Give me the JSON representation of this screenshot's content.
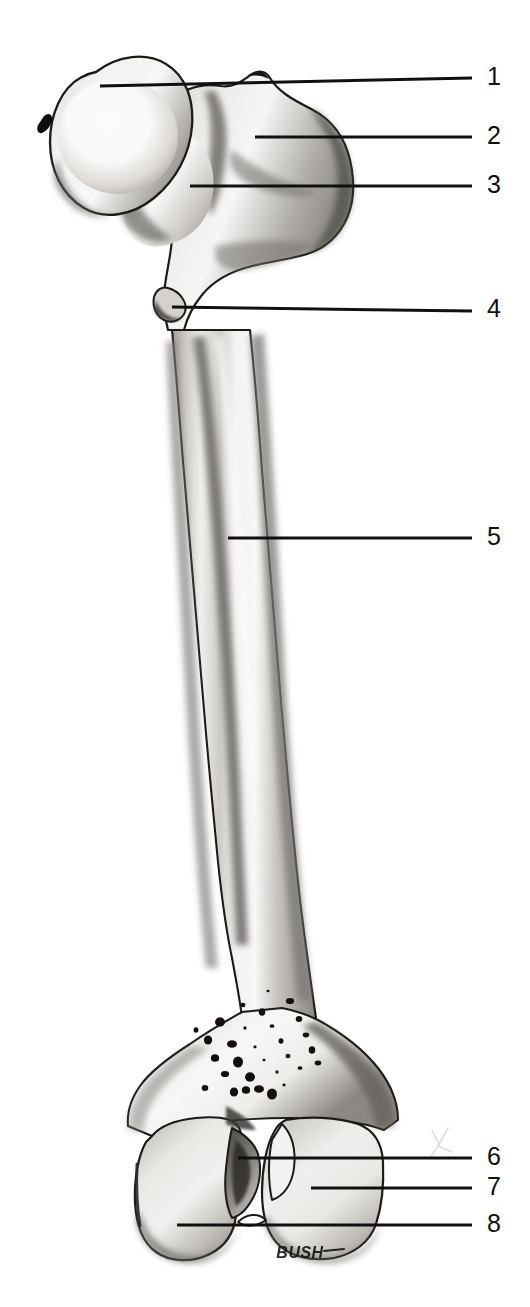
{
  "figure": {
    "kind": "anatomical-line-illustration",
    "view": "anterior",
    "background_color": "#ffffff",
    "ink_color": "#101010",
    "bone_fill_color": "#f2f1ef",
    "shadow_color": "#8d8b88",
    "signature": "BUSH",
    "dimensions": {
      "width": 530,
      "height": 1307
    }
  },
  "callouts": {
    "count": 8,
    "items": [
      {
        "number": "1",
        "num_x": 487,
        "num_y": 64,
        "line_y": 78,
        "line_x_start": 100,
        "line_x_end": 472,
        "tip_y": 86
      },
      {
        "number": "2",
        "num_x": 487,
        "num_y": 123,
        "line_y": 137,
        "line_x_start": 255,
        "line_x_end": 472,
        "tip_y": 137
      },
      {
        "number": "3",
        "num_x": 487,
        "num_y": 172,
        "line_y": 186,
        "line_x_start": 190,
        "line_x_end": 472,
        "tip_y": 186
      },
      {
        "number": "4",
        "num_x": 487,
        "num_y": 296,
        "line_y": 311,
        "line_x_start": 172,
        "line_x_end": 472,
        "tip_y": 307
      },
      {
        "number": "5",
        "num_x": 487,
        "num_y": 524,
        "line_y": 538,
        "line_x_start": 228,
        "line_x_end": 472,
        "tip_y": 538
      },
      {
        "number": "6",
        "num_x": 487,
        "num_y": 1144,
        "line_y": 1158,
        "line_x_start": 238,
        "line_x_end": 472,
        "tip_y": 1158
      },
      {
        "number": "7",
        "num_x": 487,
        "num_y": 1174,
        "line_y": 1188,
        "line_x_start": 311,
        "line_x_end": 472,
        "tip_y": 1188
      },
      {
        "number": "8",
        "num_x": 487,
        "num_y": 1211,
        "line_y": 1225,
        "line_x_start": 177,
        "line_x_end": 472,
        "tip_y": 1225
      }
    ]
  },
  "regions": [
    {
      "id": "head",
      "data_name": "femoral-head",
      "callout": "1"
    },
    {
      "id": "greater-trochanter",
      "data_name": "greater-trochanter",
      "callout": "2"
    },
    {
      "id": "neck",
      "data_name": "femoral-neck",
      "callout": "3"
    },
    {
      "id": "lesser-trochanter",
      "data_name": "lesser-trochanter",
      "callout": "4"
    },
    {
      "id": "shaft",
      "data_name": "femoral-shaft-body",
      "callout": "5"
    },
    {
      "id": "intercondylar-fossa",
      "data_name": "intercondylar-fossa",
      "callout": "6"
    },
    {
      "id": "medial-condyle",
      "data_name": "condyle-right",
      "callout": "7"
    },
    {
      "id": "lateral-condyle",
      "data_name": "condyle-left",
      "callout": "8"
    }
  ],
  "marks": {
    "nutrient_foramina": [
      [
        268,
        991
      ],
      [
        243,
        1005
      ],
      [
        262,
        1012
      ],
      [
        290,
        1001
      ],
      [
        220,
        1022
      ],
      [
        245,
        1028
      ],
      [
        272,
        1026
      ],
      [
        299,
        1019
      ],
      [
        208,
        1040
      ],
      [
        232,
        1044
      ],
      [
        255,
        1047
      ],
      [
        281,
        1041
      ],
      [
        306,
        1035
      ],
      [
        215,
        1058
      ],
      [
        238,
        1062
      ],
      [
        264,
        1060
      ],
      [
        288,
        1056
      ],
      [
        312,
        1050
      ],
      [
        225,
        1074
      ],
      [
        250,
        1077
      ],
      [
        277,
        1072
      ],
      [
        300,
        1068
      ],
      [
        205,
        1088
      ],
      [
        234,
        1092
      ],
      [
        259,
        1089
      ],
      [
        284,
        1085
      ],
      [
        196,
        1030
      ],
      [
        318,
        1063
      ],
      [
        246,
        1090
      ],
      [
        272,
        1094
      ]
    ],
    "fovea_capitis": {
      "x": 46,
      "y": 124
    },
    "pencil_scribble": {
      "x": 440,
      "y": 1140
    }
  },
  "signature_pos": {
    "x": 300,
    "y": 1253
  }
}
